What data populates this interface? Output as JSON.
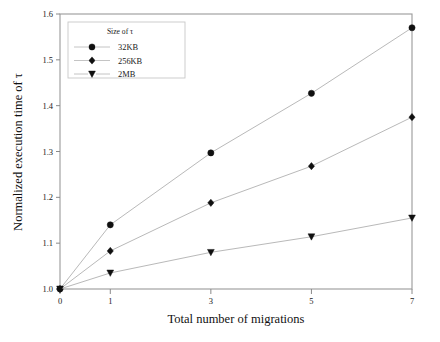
{
  "chart_data": {
    "type": "line",
    "title": "",
    "xlabel": "Total number of migrations",
    "ylabel": "Normalized execution time of τ",
    "x": [
      0,
      1,
      3,
      5,
      7
    ],
    "xtick_labels": [
      "0",
      "1",
      "3",
      "5",
      "7"
    ],
    "ytick_labels": [
      "1.0",
      "1.1",
      "1.2",
      "1.3",
      "1.4",
      "1.5",
      "1.6"
    ],
    "yticks": [
      1.0,
      1.1,
      1.2,
      1.3,
      1.4,
      1.5,
      1.6
    ],
    "xlim": [
      0,
      7
    ],
    "ylim": [
      1.0,
      1.6
    ],
    "grid": false,
    "legend_position": "top-left",
    "legend_title": "Size of τ",
    "series": [
      {
        "name": "32KB",
        "marker": "circle",
        "values": [
          1.0,
          1.14,
          1.297,
          1.427,
          1.57
        ]
      },
      {
        "name": "256KB",
        "marker": "diamond",
        "values": [
          1.0,
          1.083,
          1.188,
          1.268,
          1.375
        ]
      },
      {
        "name": "2MB",
        "marker": "triangle-down",
        "values": [
          1.0,
          1.035,
          1.08,
          1.114,
          1.155
        ]
      }
    ],
    "colors": {
      "marker": "#101010",
      "line": "#b9b9b9",
      "axis": "#9a9a9a",
      "text": "#1a1a1a",
      "background": "#ffffff"
    }
  }
}
